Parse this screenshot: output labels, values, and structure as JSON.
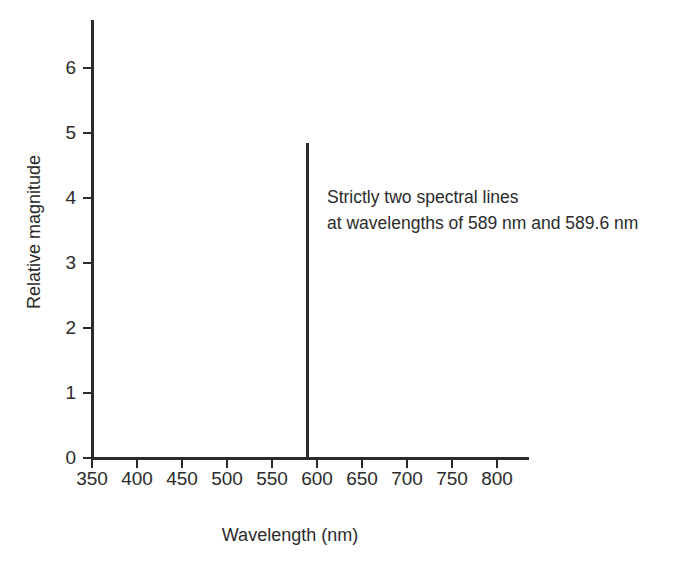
{
  "chart_data": {
    "type": "bar",
    "title": "",
    "subtitle": "",
    "xlabel": "Wavelength (nm)",
    "ylabel": "Relative magnitude",
    "xlim": [
      350,
      820
    ],
    "ylim": [
      0,
      6.75
    ],
    "grid": false,
    "legend": null,
    "x_tick_labels": [
      "350",
      "400",
      "450",
      "500",
      "550",
      "600",
      "650",
      "700",
      "750",
      "800"
    ],
    "x_tick_values": [
      350,
      400,
      450,
      500,
      550,
      600,
      650,
      700,
      750,
      800
    ],
    "y_tick_labels": [
      "0",
      "1",
      "2",
      "3",
      "4",
      "5",
      "6"
    ],
    "y_tick_values": [
      0,
      1,
      2,
      3,
      4,
      5,
      6
    ],
    "series": [
      {
        "name": "Sodium emission spectrum",
        "points": [
          {
            "x": 589,
            "y": 4.85
          }
        ]
      }
    ],
    "annotations": [
      {
        "line1": "Strictly two spectral lines",
        "line2": "at wavelengths of 589 nm and 589.6 nm"
      }
    ]
  },
  "colors": {
    "ink": "#2b2b2b",
    "background": "#ffffff"
  }
}
